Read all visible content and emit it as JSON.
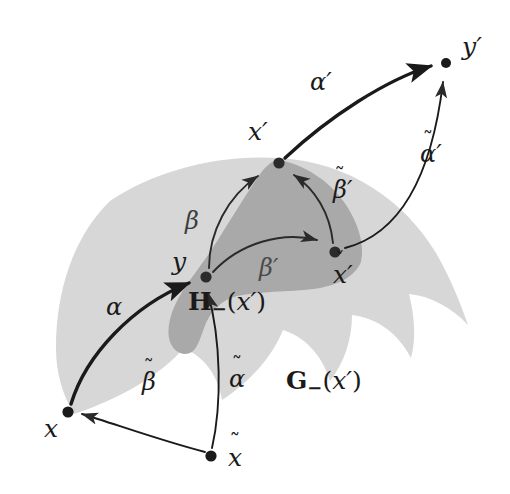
{
  "figure": {
    "kind": "mathematical-diagram",
    "background_color": "#ffffff",
    "outer_surface_color": "#d7d7d7",
    "inner_surface_color": "#a9a9a9",
    "ink_color": "#1a1a1a"
  },
  "points": [
    {
      "id": "y-prime",
      "label_base": "y",
      "accent": "none",
      "prime": "′",
      "x": 446,
      "y": 63,
      "label_x": 462,
      "label_y": 34,
      "dot_r": 5.0
    },
    {
      "id": "x-prime",
      "label_base": "x",
      "accent": "none",
      "prime": "′",
      "x": 279,
      "y": 163,
      "label_x": 248,
      "label_y": 119,
      "dot_r": 5.6
    },
    {
      "id": "x-check-prime",
      "label_base": "x",
      "accent": "caron",
      "prime": "′",
      "x": 335,
      "y": 252,
      "label_x": 333,
      "label_y": 262,
      "dot_r": 5.6
    },
    {
      "id": "y",
      "label_base": "y",
      "accent": "none",
      "prime": "",
      "x": 206,
      "y": 277,
      "label_x": 172,
      "label_y": 249,
      "dot_r": 5.6
    },
    {
      "id": "x",
      "label_base": "x",
      "accent": "none",
      "prime": "",
      "x": 68,
      "y": 412,
      "label_x": 44,
      "label_y": 416,
      "dot_r": 5.6
    },
    {
      "id": "x-tilde",
      "label_base": "x",
      "accent": "tilde",
      "prime": "",
      "x": 211,
      "y": 456,
      "label_x": 228,
      "label_y": 445,
      "dot_r": 5.6
    }
  ],
  "arcs": [
    {
      "id": "alpha-prime",
      "label_base": "α",
      "accent": "none",
      "prime": "′",
      "label_x": 310,
      "label_y": 70,
      "weight": "heavy",
      "from": "x-prime",
      "to": "y-prime"
    },
    {
      "id": "alpha-tilde-prime",
      "label_base": "α",
      "accent": "tilde",
      "prime": "′",
      "label_x": 420,
      "label_y": 142,
      "weight": "light",
      "from": "x-check-prime",
      "to": "y-prime"
    },
    {
      "id": "beta-tilde-prime",
      "label_base": "β",
      "accent": "tilde",
      "prime": "′",
      "label_x": 333,
      "label_y": 178,
      "weight": "light",
      "from": "x-check-prime",
      "to": "x-prime"
    },
    {
      "id": "beta",
      "label_base": "β",
      "accent": "none",
      "prime": "",
      "label_x": 185,
      "label_y": 209,
      "weight": "light",
      "from": "y",
      "to": "x-prime"
    },
    {
      "id": "beta-prime",
      "label_base": "β",
      "accent": "none",
      "prime": "′",
      "label_x": 259,
      "label_y": 256,
      "weight": "light",
      "from": "y",
      "to": "x-check-prime"
    },
    {
      "id": "alpha",
      "label_base": "α",
      "accent": "none",
      "prime": "",
      "label_x": 106,
      "label_y": 295,
      "weight": "heavy",
      "from": "x",
      "to": "y"
    },
    {
      "id": "alpha-tilde",
      "label_base": "α",
      "accent": "tilde",
      "prime": "",
      "label_x": 229,
      "label_y": 367,
      "weight": "light",
      "from": "x-tilde",
      "to": "y"
    },
    {
      "id": "beta-tilde",
      "label_base": "β",
      "accent": "tilde",
      "prime": "",
      "label_x": 142,
      "label_y": 370,
      "weight": "light",
      "from": "x-tilde",
      "to": "x"
    }
  ],
  "region_labels": [
    {
      "id": "H-minus",
      "bold_letter": "H",
      "subscript": "−",
      "arg_open": "(",
      "arg_letter": "x",
      "arg_prime": "′",
      "arg_close": ")",
      "x": 188,
      "y": 289
    },
    {
      "id": "G-minus",
      "bold_letter": "G",
      "subscript": "−",
      "arg_open": "(",
      "arg_letter": "x",
      "arg_prime": "′",
      "arg_close": ")",
      "x": 286,
      "y": 368
    }
  ],
  "accent_glyphs": {
    "tilde": "˜",
    "caron": "ˇ",
    "none": ""
  }
}
